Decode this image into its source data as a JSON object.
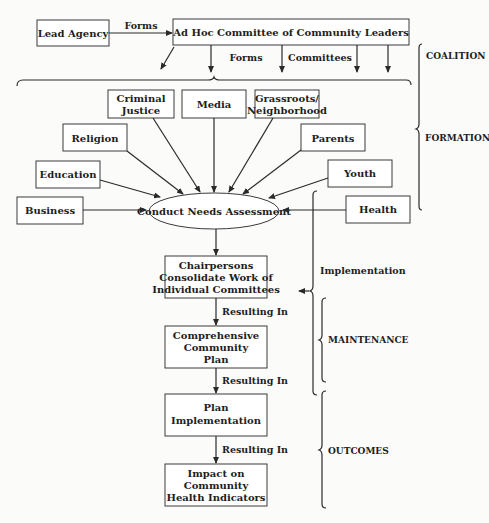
{
  "diagram": {
    "top": {
      "lead_agency": "Lead Agency",
      "forms_label_1": "Forms",
      "ad_hoc": "Ad Hoc Committee of Community Leaders",
      "forms_label_2": "Forms",
      "committees_label": "Committees"
    },
    "committees": {
      "criminal_justice_1": "Criminal",
      "criminal_justice_2": "Justice",
      "media": "Media",
      "grassroots_1": "Grassroots/",
      "grassroots_2": "Neighborhood",
      "religion": "Religion",
      "parents": "Parents",
      "education": "Education",
      "youth": "Youth",
      "business": "Business",
      "health": "Health"
    },
    "center": "Conduct Needs Assessment",
    "flow": {
      "chair_1": "Chairpersons",
      "chair_2": "Consolidate Work of",
      "chair_3": "Individual Committees",
      "resulting_in_1": "Resulting In",
      "plan_1": "Comprehensive",
      "plan_2": "Community",
      "plan_3": "Plan",
      "resulting_in_2": "Resulting In",
      "impl_1": "Plan",
      "impl_2": "Implementation",
      "resulting_in_3": "Resulting In",
      "impact_1": "Impact on",
      "impact_2": "Community",
      "impact_3": "Health Indicators"
    },
    "phases": {
      "coalition": "COALITION",
      "formation": "FORMATION",
      "implementation": "Implementation",
      "maintenance": "MAINTENANCE",
      "outcomes": "OUTCOMES"
    }
  }
}
